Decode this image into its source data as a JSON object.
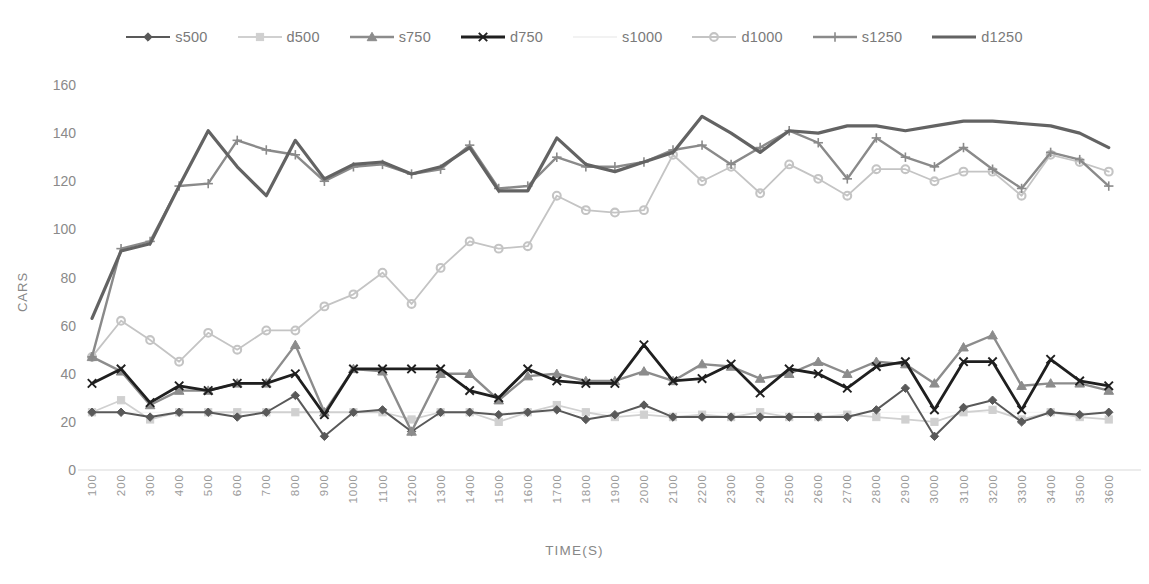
{
  "chart_data": {
    "type": "line",
    "title": "",
    "xlabel": "TIME(S)",
    "ylabel": "CARS",
    "grid": false,
    "legend_position": "top",
    "ylim": [
      0,
      160
    ],
    "yticks": [
      0,
      20,
      40,
      60,
      80,
      100,
      120,
      140,
      160
    ],
    "categories": [
      100,
      200,
      300,
      400,
      500,
      600,
      700,
      800,
      900,
      1000,
      1100,
      1200,
      1300,
      1400,
      1500,
      1600,
      1700,
      1800,
      1900,
      2000,
      2100,
      2200,
      2300,
      2400,
      2500,
      2600,
      2700,
      2800,
      2900,
      3000,
      3100,
      3200,
      3300,
      3400,
      3500,
      3600
    ],
    "series": [
      {
        "name": "s500",
        "color": "#595959",
        "marker": "diamond",
        "width": 2.0,
        "values": [
          24,
          24,
          22,
          24,
          24,
          22,
          24,
          31,
          14,
          24,
          25,
          16,
          24,
          24,
          23,
          24,
          25,
          21,
          23,
          27,
          22,
          22,
          22,
          22,
          22,
          22,
          22,
          25,
          34,
          14,
          26,
          29,
          20,
          24,
          23,
          24
        ]
      },
      {
        "name": "d500",
        "color": "#d0d0d0",
        "marker": "square",
        "width": 1.8,
        "values": [
          24,
          29,
          21,
          24,
          24,
          24,
          24,
          24,
          24,
          24,
          24,
          21,
          24,
          24,
          20,
          24,
          27,
          24,
          22,
          23,
          22,
          23,
          22,
          24,
          22,
          22,
          23,
          22,
          21,
          20,
          24,
          25,
          21,
          24,
          22,
          21
        ]
      },
      {
        "name": "s750",
        "color": "#8c8c8c",
        "marker": "triangle",
        "width": 2.4,
        "values": [
          47,
          41,
          27,
          33,
          33,
          36,
          36,
          52,
          24,
          42,
          41,
          16,
          40,
          40,
          29,
          39,
          40,
          37,
          37,
          41,
          37,
          44,
          43,
          38,
          40,
          45,
          40,
          45,
          44,
          36,
          51,
          56,
          35,
          36,
          36,
          33
        ]
      },
      {
        "name": "d750",
        "color": "#1f1f1f",
        "marker": "x",
        "width": 2.8,
        "values": [
          36,
          42,
          28,
          35,
          33,
          36,
          36,
          40,
          23,
          42,
          42,
          42,
          42,
          33,
          30,
          42,
          37,
          36,
          36,
          52,
          37,
          38,
          44,
          32,
          42,
          40,
          34,
          43,
          45,
          25,
          45,
          45,
          25,
          46,
          37,
          35
        ]
      },
      {
        "name": "s1000",
        "color": "#f2f2f2",
        "marker": "none",
        "width": 1.2,
        "values": [
          24,
          24,
          24,
          24,
          24,
          24,
          24,
          24,
          24,
          24,
          24,
          24,
          24,
          24,
          24,
          24,
          24,
          24,
          24,
          24,
          24,
          24,
          24,
          24,
          24,
          24,
          24,
          24,
          24,
          24,
          24,
          24,
          24,
          24,
          24,
          24
        ]
      },
      {
        "name": "d1000",
        "color": "#c4c4c4",
        "marker": "circle",
        "width": 1.8,
        "values": [
          47,
          62,
          54,
          45,
          57,
          50,
          58,
          58,
          68,
          73,
          82,
          69,
          84,
          95,
          92,
          93,
          114,
          108,
          107,
          108,
          131,
          120,
          126,
          115,
          127,
          121,
          114,
          125,
          125,
          120,
          124,
          124,
          114,
          131,
          128,
          124
        ]
      },
      {
        "name": "s1250",
        "color": "#8a8a8a",
        "marker": "plus",
        "width": 2.4,
        "values": [
          47,
          92,
          95,
          118,
          119,
          137,
          133,
          131,
          120,
          126,
          127,
          123,
          125,
          135,
          117,
          118,
          130,
          126,
          126,
          128,
          133,
          135,
          127,
          134,
          141,
          136,
          121,
          138,
          130,
          126,
          134,
          125,
          117,
          132,
          129,
          118
        ]
      },
      {
        "name": "d1250",
        "color": "#636363",
        "marker": "none",
        "width": 3.2,
        "values": [
          63,
          91,
          94,
          118,
          141,
          126,
          114,
          137,
          121,
          127,
          128,
          123,
          126,
          134,
          116,
          116,
          138,
          127,
          124,
          128,
          132,
          147,
          140,
          132,
          141,
          140,
          143,
          143,
          141,
          143,
          145,
          145,
          144,
          143,
          140,
          134
        ]
      }
    ]
  },
  "axes": {
    "y_tick_labels": [
      "160",
      "140",
      "120",
      "100",
      "80",
      "60",
      "40",
      "20",
      "0"
    ],
    "x_tick_labels": [
      "100",
      "200",
      "300",
      "400",
      "500",
      "600",
      "700",
      "800",
      "900",
      "1000",
      "1100",
      "1200",
      "1300",
      "1400",
      "1500",
      "1600",
      "1700",
      "1800",
      "1900",
      "2000",
      "2100",
      "2200",
      "2300",
      "2400",
      "2500",
      "2600",
      "2700",
      "2800",
      "2900",
      "3000",
      "3100",
      "3200",
      "3300",
      "3400",
      "3500",
      "3600"
    ],
    "y_title": "CARS",
    "x_title": "TIME(S)"
  },
  "legend": {
    "items": [
      {
        "label": "s500",
        "color": "#595959",
        "marker": "diamond"
      },
      {
        "label": "d500",
        "color": "#d0d0d0",
        "marker": "square"
      },
      {
        "label": "s750",
        "color": "#8c8c8c",
        "marker": "triangle"
      },
      {
        "label": "d750",
        "color": "#1f1f1f",
        "marker": "x"
      },
      {
        "label": "s1000",
        "color": "#f2f2f2",
        "marker": "none"
      },
      {
        "label": "d1000",
        "color": "#c4c4c4",
        "marker": "circle"
      },
      {
        "label": "s1250",
        "color": "#8a8a8a",
        "marker": "plus"
      },
      {
        "label": "d1250",
        "color": "#636363",
        "marker": "none"
      }
    ]
  }
}
